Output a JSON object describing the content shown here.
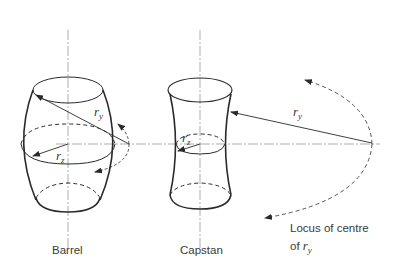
{
  "figure": {
    "shapes": [
      {
        "id": "barrel",
        "label": "Barrel",
        "radius_labels": {
          "ry": {
            "base": "r",
            "sub": "y"
          },
          "rz": {
            "base": "r",
            "sub": "z"
          }
        }
      },
      {
        "id": "capstan",
        "label": "Capstan",
        "radius_labels": {
          "ry": {
            "base": "r",
            "sub": "y"
          },
          "rz": {
            "base": "r",
            "sub": "z"
          }
        }
      }
    ],
    "locus_caption": {
      "line1": "Locus of centre",
      "line2_prefix": "of ",
      "line2_symbol": "r",
      "line2_sub": "y"
    },
    "colors": {
      "stroke": "#2a2a2a",
      "axis": "#8a8a8a",
      "text": "#3a3a3a",
      "background": "#ffffff"
    }
  }
}
